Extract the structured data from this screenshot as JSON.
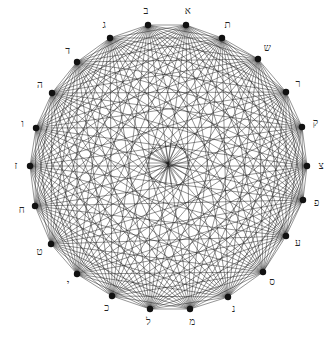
{
  "diagram": {
    "type": "complete-graph",
    "node_count": 22,
    "edge_count": 231,
    "center": [
      168,
      163
    ],
    "center_radius": 22,
    "colors": {
      "line": "#1a1a1a",
      "node": "#111111",
      "label": "#222222",
      "background": "#ffffff"
    },
    "nodes": [
      {
        "label": "א",
        "x": 186,
        "y": 25
      },
      {
        "label": "ב",
        "x": 148,
        "y": 25
      },
      {
        "label": "ג",
        "x": 110,
        "y": 38
      },
      {
        "label": "ד",
        "x": 77,
        "y": 62
      },
      {
        "label": "ה",
        "x": 52,
        "y": 93
      },
      {
        "label": "ו",
        "x": 36,
        "y": 128
      },
      {
        "label": "ז",
        "x": 30,
        "y": 166
      },
      {
        "label": "ח",
        "x": 35,
        "y": 206
      },
      {
        "label": "ט",
        "x": 51,
        "y": 244
      },
      {
        "label": "י",
        "x": 77,
        "y": 274
      },
      {
        "label": "כ",
        "x": 112,
        "y": 296
      },
      {
        "label": "ל",
        "x": 150,
        "y": 309
      },
      {
        "label": "מ",
        "x": 190,
        "y": 309
      },
      {
        "label": "נ",
        "x": 228,
        "y": 297
      },
      {
        "label": "ס",
        "x": 263,
        "y": 272
      },
      {
        "label": "ע",
        "x": 286,
        "y": 236
      },
      {
        "label": "פ",
        "x": 303,
        "y": 200
      },
      {
        "label": "צ",
        "x": 307,
        "y": 166
      },
      {
        "label": "ק",
        "x": 302,
        "y": 127
      },
      {
        "label": "ר",
        "x": 286,
        "y": 92
      },
      {
        "label": "ש",
        "x": 258,
        "y": 59
      },
      {
        "label": "ת",
        "x": 222,
        "y": 38
      }
    ]
  }
}
